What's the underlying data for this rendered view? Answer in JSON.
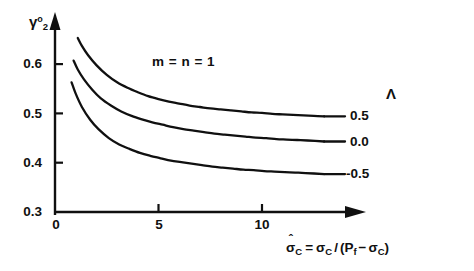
{
  "chart_data": {
    "type": "line",
    "title": "",
    "subtitle": "",
    "xlabel": "σ̂_C = σ_C / (P_f − σ_C)",
    "ylabel": "γ₂⁰",
    "xlim": [
      0,
      14.5
    ],
    "ylim": [
      0.3,
      0.68
    ],
    "xticks": [
      0,
      5,
      10
    ],
    "yticks": [
      0.3,
      0.4,
      0.5,
      0.6
    ],
    "xtick_labels": [
      "0",
      "5",
      "10"
    ],
    "ytick_labels": [
      "0.3",
      "0.4",
      "0.5",
      "0.6"
    ],
    "grid": false,
    "legend_position": "right-of-curve-ends",
    "legend_title": "Λ",
    "annotations": [
      "m = n = 1"
    ],
    "series": [
      {
        "name": "0.5",
        "label": "0.5",
        "lambda": 0.5,
        "x": [
          1.1,
          1.3,
          1.6,
          2.0,
          2.5,
          3.0,
          3.5,
          4.0,
          4.5,
          5.0,
          5.5,
          6.0,
          6.5,
          7.0,
          7.5,
          8.0,
          8.5,
          9.0,
          9.5,
          10.0,
          10.5,
          11.0,
          11.5,
          12.0,
          12.5,
          13.0
        ],
        "y": [
          0.653,
          0.637,
          0.618,
          0.598,
          0.578,
          0.563,
          0.552,
          0.543,
          0.535,
          0.529,
          0.524,
          0.52,
          0.516,
          0.513,
          0.51,
          0.508,
          0.506,
          0.504,
          0.502,
          0.501,
          0.499,
          0.498,
          0.497,
          0.496,
          0.495,
          0.494
        ]
      },
      {
        "name": "0.0",
        "label": "0.0",
        "lambda": 0.0,
        "x": [
          0.9,
          1.1,
          1.4,
          1.8,
          2.2,
          2.7,
          3.2,
          3.7,
          4.2,
          4.7,
          5.2,
          5.7,
          6.2,
          6.7,
          7.2,
          7.7,
          8.2,
          8.7,
          9.2,
          9.7,
          10.2,
          10.7,
          11.2,
          11.7,
          12.2,
          13.0
        ],
        "y": [
          0.607,
          0.589,
          0.569,
          0.548,
          0.531,
          0.516,
          0.504,
          0.495,
          0.488,
          0.482,
          0.477,
          0.472,
          0.468,
          0.465,
          0.462,
          0.459,
          0.457,
          0.455,
          0.453,
          0.451,
          0.45,
          0.448,
          0.447,
          0.446,
          0.445,
          0.443
        ]
      },
      {
        "name": "-0.5",
        "label": "-0.5",
        "lambda": -0.5,
        "x": [
          0.8,
          1.0,
          1.3,
          1.7,
          2.1,
          2.6,
          3.1,
          3.6,
          4.1,
          4.6,
          5.1,
          5.6,
          6.1,
          6.6,
          7.1,
          7.6,
          8.1,
          8.6,
          9.1,
          9.6,
          10.1,
          10.6,
          11.1,
          11.6,
          12.1,
          13.0
        ],
        "y": [
          0.563,
          0.54,
          0.513,
          0.487,
          0.468,
          0.45,
          0.437,
          0.428,
          0.42,
          0.414,
          0.409,
          0.404,
          0.401,
          0.398,
          0.395,
          0.392,
          0.39,
          0.388,
          0.386,
          0.385,
          0.383,
          0.382,
          0.381,
          0.38,
          0.379,
          0.377
        ]
      }
    ]
  },
  "axes": {
    "y_title": {
      "base": "γ",
      "sup": "o",
      "sub": "2"
    },
    "x_title": {
      "lhs_base": "σ",
      "lhs_sub": "C",
      "lhs_hat": "ˆ",
      "eq": "=",
      "num_base": "σ",
      "num_sub": "C",
      "slash": "/",
      "open": "(",
      "p_base": "P",
      "p_sub": "f",
      "minus": "−",
      "den_base": "σ",
      "den_sub": "C",
      "close": ")"
    }
  },
  "legend": {
    "header": "Λ",
    "entries": [
      {
        "label": "0.5"
      },
      {
        "label": "0.0"
      },
      {
        "label": "-0.5"
      }
    ]
  },
  "annotation": {
    "text": "m = n = 1"
  },
  "colors": {
    "ink": "#101010",
    "background": "#ffffff"
  }
}
